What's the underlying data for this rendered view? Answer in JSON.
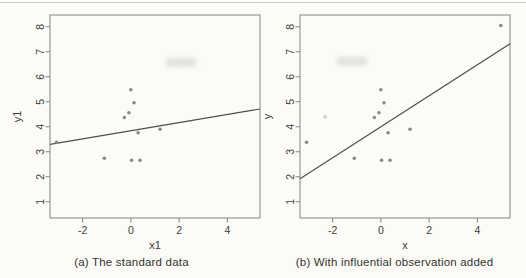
{
  "figure": {
    "point_color": "#8a8a85",
    "faint_point_color": "#d7d7d1",
    "line_color": "#4c4c49",
    "axis_color": "#858580",
    "text_color": "#3d3d3a",
    "background": "#fcfbf8",
    "top_rule_color": "#cccdc9"
  },
  "chart_data": [
    {
      "type": "scatter",
      "caption": "(a) The standard data",
      "xlabel": "x1",
      "ylabel": "y1",
      "xlim": [
        -3.35,
        5.35
      ],
      "ylim": [
        0.35,
        8.47
      ],
      "xticks": [
        -2,
        0,
        2,
        4
      ],
      "xtick_labels": [
        "-2",
        "0",
        "2",
        "4"
      ],
      "yticks": [
        1,
        2,
        3,
        4,
        5,
        6,
        7,
        8
      ],
      "ytick_labels": [
        "1",
        "2",
        "3",
        "4",
        "5",
        "6",
        "7",
        "8"
      ],
      "grid": false,
      "points": [
        [
          0.0,
          5.48
        ],
        [
          0.13,
          4.96
        ],
        [
          -0.08,
          4.56
        ],
        [
          -0.27,
          4.37
        ],
        [
          0.3,
          3.76
        ],
        [
          1.21,
          3.9
        ],
        [
          -1.1,
          2.74
        ],
        [
          0.03,
          2.66
        ],
        [
          0.38,
          2.66
        ],
        [
          -3.08,
          3.38
        ]
      ],
      "faint_points": [],
      "regression_line": {
        "intercept": 3.84,
        "slope": 0.163
      }
    },
    {
      "type": "scatter",
      "caption": "(b) With influential observation added",
      "xlabel": "x",
      "ylabel": "y",
      "xlim": [
        -3.35,
        5.35
      ],
      "ylim": [
        0.35,
        8.47
      ],
      "xticks": [
        -2,
        0,
        2,
        4
      ],
      "xtick_labels": [
        "-2",
        "0",
        "2",
        "4"
      ],
      "yticks": [
        1,
        2,
        3,
        4,
        5,
        6,
        7,
        8
      ],
      "ytick_labels": [
        "1",
        "2",
        "3",
        "4",
        "5",
        "6",
        "7",
        "8"
      ],
      "grid": false,
      "points": [
        [
          0.0,
          5.48
        ],
        [
          0.13,
          4.96
        ],
        [
          -0.08,
          4.56
        ],
        [
          -0.27,
          4.37
        ],
        [
          0.3,
          3.76
        ],
        [
          1.21,
          3.9
        ],
        [
          -1.1,
          2.74
        ],
        [
          0.03,
          2.66
        ],
        [
          0.38,
          2.66
        ],
        [
          -3.08,
          3.38
        ],
        [
          4.97,
          8.05
        ]
      ],
      "faint_points": [
        [
          -2.31,
          4.4
        ]
      ],
      "regression_line": {
        "intercept": 4.0,
        "slope": 0.62
      }
    }
  ]
}
